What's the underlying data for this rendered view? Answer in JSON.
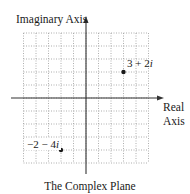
{
  "diagram": {
    "title": "The Complex Plane",
    "axes": {
      "x_label_line1": "Real",
      "x_label_line2": "Axis",
      "y_label": "Imaginary Axis"
    },
    "grid": {
      "x_range": [
        -5,
        5
      ],
      "y_range": [
        -5,
        5
      ],
      "unit_px_x": 12.5,
      "unit_px_y": 13,
      "origin_px": [
        86,
        98
      ],
      "style": "dotted"
    },
    "points": [
      {
        "re": 3,
        "im": 2,
        "label_re": "3 + 2",
        "label_im": "i"
      },
      {
        "re": -2,
        "im": -4,
        "label_re": "−2 − 4",
        "label_im": "i"
      }
    ],
    "colors": {
      "axis": "#333333",
      "grid": "#9a9a9a",
      "point": "#1a1a1a",
      "text": "#1a1a1a"
    }
  }
}
